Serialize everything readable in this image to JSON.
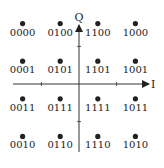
{
  "diagram": {
    "axes": {
      "horizontal_label": "I",
      "vertical_label": "Q"
    },
    "grid": {
      "columns": [
        -3,
        -1,
        1,
        3
      ],
      "rows": [
        3,
        1,
        -1,
        -3
      ]
    },
    "points": [
      {
        "i": -3,
        "q": 3,
        "label": "0000"
      },
      {
        "i": -1,
        "q": 3,
        "label": "0100"
      },
      {
        "i": 1,
        "q": 3,
        "label": "1100"
      },
      {
        "i": 3,
        "q": 3,
        "label": "1000"
      },
      {
        "i": -3,
        "q": 1,
        "label": "0001"
      },
      {
        "i": -1,
        "q": 1,
        "label": "0101"
      },
      {
        "i": 1,
        "q": 1,
        "label": "1101"
      },
      {
        "i": 3,
        "q": 1,
        "label": "1001"
      },
      {
        "i": -3,
        "q": -1,
        "label": "0011"
      },
      {
        "i": -1,
        "q": -1,
        "label": "0111"
      },
      {
        "i": 1,
        "q": -1,
        "label": "1111"
      },
      {
        "i": 3,
        "q": -1,
        "label": "1011"
      },
      {
        "i": -3,
        "q": -3,
        "label": "0010"
      },
      {
        "i": -1,
        "q": -3,
        "label": "0110"
      },
      {
        "i": 1,
        "q": -3,
        "label": "1110"
      },
      {
        "i": 3,
        "q": -3,
        "label": "1010"
      }
    ],
    "ticks": [
      -2,
      2
    ],
    "colors": {
      "ink": "#222222",
      "axis": "#333333",
      "background": "#ffffff"
    }
  }
}
